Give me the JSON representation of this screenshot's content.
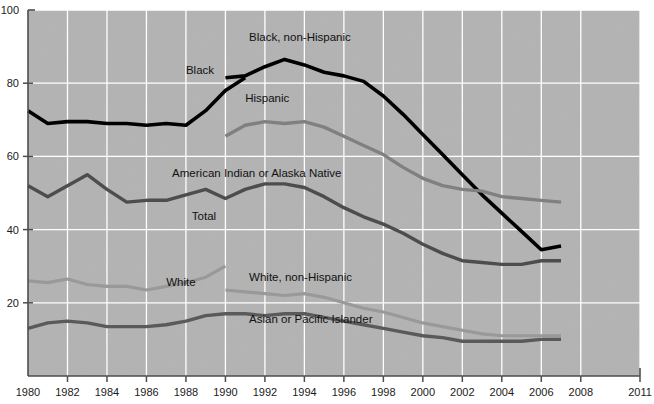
{
  "chart_data": {
    "type": "line",
    "title": "",
    "subtitle": "",
    "xlabel": "",
    "ylabel": "",
    "xlim": [
      1980,
      2011
    ],
    "ylim": [
      0,
      100
    ],
    "grid": true,
    "legend_position": "inline-labels",
    "background_color": "#b3b3b3",
    "plot_border_color": "#4d4d4d",
    "gridline_color": "#ffffff",
    "x_ticks": [
      1980,
      1982,
      1984,
      1986,
      1988,
      1990,
      1992,
      1994,
      1996,
      1998,
      2000,
      2002,
      2004,
      2006,
      2008,
      2011
    ],
    "x_tick_labels": [
      "1980",
      "1982",
      "1984",
      "1986",
      "1988",
      "1990",
      "1992",
      "1994",
      "1996",
      "1998",
      "2000",
      "2002",
      "2004",
      "2006",
      "2008",
      "2011"
    ],
    "y_ticks": [
      0,
      20,
      40,
      60,
      80,
      100
    ],
    "y_tick_labels": [
      "0",
      "20",
      "40",
      "60",
      "80",
      "100"
    ],
    "y_tick_labels_shown": [
      "20",
      "40",
      "60",
      "80",
      "100"
    ],
    "series": [
      {
        "name": "Black",
        "label": "Black",
        "color": "#000000",
        "width": 3.6,
        "label_x": 1988.0,
        "label_y": 82.5,
        "x": [
          1980,
          1981,
          1982,
          1983,
          1984,
          1985,
          1986,
          1987,
          1988,
          1989,
          1990,
          1991
        ],
        "values": [
          72.5,
          69.0,
          69.5,
          69.5,
          69.0,
          69.0,
          68.5,
          69.0,
          68.5,
          72.5,
          78.0,
          81.5
        ]
      },
      {
        "name": "Black, non-Hispanic",
        "label": "Black, non-Hispanic",
        "color": "#000000",
        "width": 3.6,
        "label_x": 1991.2,
        "label_y": 91.5,
        "x": [
          1990,
          1991,
          1992,
          1993,
          1994,
          1995,
          1996,
          1997,
          1998,
          1999,
          2000,
          2001,
          2002,
          2003,
          2004,
          2005,
          2006,
          2007
        ],
        "values": [
          81.5,
          82.0,
          84.5,
          86.5,
          85.0,
          83.0,
          82.0,
          80.5,
          76.5,
          71.5,
          66.0,
          60.5,
          55.0,
          49.5,
          44.5,
          39.5,
          34.5,
          35.5
        ]
      },
      {
        "name": "Hispanic",
        "label": "Hispanic",
        "color": "#808080",
        "width": 3.4,
        "label_x": 1991.0,
        "label_y": 75.0,
        "x": [
          1990,
          1991,
          1992,
          1993,
          1994,
          1995,
          1996,
          1997,
          1998,
          1999,
          2000,
          2001,
          2002,
          2003,
          2004,
          2005,
          2006,
          2007
        ],
        "values": [
          65.5,
          68.5,
          69.5,
          69.0,
          69.5,
          68.0,
          65.5,
          63.0,
          60.5,
          57.0,
          54.0,
          52.0,
          51.0,
          50.5,
          49.0,
          48.5,
          48.0,
          47.5
        ]
      },
      {
        "name": "American Indian or Alaska Native",
        "label": "American Indian or Alaska Native",
        "color": "#4d4d4d",
        "width": 3.4,
        "label_x": 1987.3,
        "label_y": 54.5,
        "x": [
          1980,
          1981,
          1982,
          1983,
          1984,
          1985,
          1986,
          1987,
          1988,
          1989,
          1990,
          1991,
          1992,
          1993,
          1994,
          1995,
          1996,
          1997,
          1998,
          1999,
          2000,
          2001,
          2002,
          2003,
          2004,
          2005,
          2006,
          2007
        ],
        "values": [
          52.0,
          49.0,
          52.0,
          55.0,
          51.0,
          47.5,
          48.0,
          48.0,
          49.5,
          51.0,
          48.5,
          51.0,
          52.5,
          52.5,
          51.5,
          49.0,
          46.0,
          43.5,
          41.5,
          39.0,
          36.0,
          33.5,
          31.5,
          31.0,
          30.5,
          30.5,
          31.5,
          31.5
        ]
      },
      {
        "name": "Total",
        "label": "Total",
        "color": "#4d4d4d",
        "width": 3.4,
        "label_x": 1988.3,
        "label_y": 42.5,
        "x": [],
        "values": []
      },
      {
        "name": "White",
        "label": "White",
        "color": "#999999",
        "width": 3.2,
        "label_x": 1987.0,
        "label_y": 24.5,
        "x": [
          1980,
          1981,
          1982,
          1983,
          1984,
          1985,
          1986,
          1987,
          1988,
          1989,
          1990
        ],
        "values": [
          26.0,
          25.5,
          26.5,
          25.0,
          24.5,
          24.5,
          23.5,
          24.5,
          25.5,
          27.0,
          30.0
        ]
      },
      {
        "name": "White, non-Hispanic",
        "label": "White, non-Hispanic",
        "color": "#999999",
        "width": 3.2,
        "label_x": 1991.2,
        "label_y": 26.0,
        "x": [
          1990,
          1991,
          1992,
          1993,
          1994,
          1995,
          1996,
          1997,
          1998,
          1999,
          2000,
          2001,
          2002,
          2003,
          2004,
          2005,
          2006,
          2007
        ],
        "values": [
          23.5,
          23.0,
          22.5,
          22.0,
          22.5,
          21.5,
          20.0,
          18.5,
          17.5,
          16.0,
          14.5,
          13.5,
          12.5,
          11.5,
          11.0,
          11.0,
          11.0,
          11.0
        ]
      },
      {
        "name": "Asian or Pacific Islander",
        "label": "Asian or Pacific Islander",
        "color": "#5a5a5a",
        "width": 3.4,
        "label_x": 1991.2,
        "label_y": 14.5,
        "x": [
          1980,
          1981,
          1982,
          1983,
          1984,
          1985,
          1986,
          1987,
          1988,
          1989,
          1990,
          1991,
          1992,
          1993,
          1994,
          1995,
          1996,
          1997,
          1998,
          1999,
          2000,
          2001,
          2002,
          2003,
          2004,
          2005,
          2006,
          2007
        ],
        "values": [
          13.0,
          14.5,
          15.0,
          14.5,
          13.5,
          13.5,
          13.5,
          14.0,
          15.0,
          16.5,
          17.0,
          17.0,
          16.5,
          17.0,
          17.0,
          16.0,
          15.0,
          14.0,
          13.0,
          12.0,
          11.0,
          10.5,
          9.5,
          9.5,
          9.5,
          9.5,
          10.0,
          10.0
        ]
      }
    ]
  }
}
